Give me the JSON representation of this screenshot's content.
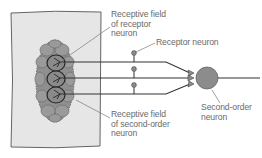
{
  "figure": {
    "labels": {
      "receptive_field_receptor": "Receptive field\nof receptor\nneuron",
      "receptor_neuron": "Receptor neuron",
      "receptive_field_second_order": "Receptive field\nof second-order\nneuron",
      "second_order_neuron": "Second-order\nneuron"
    },
    "colors": {
      "skin_fill": "#e6e6e6",
      "skin_border": "#555555",
      "field_fill": "#8f8f8f",
      "field_cell_stroke": "#6e6e6e",
      "receptor_field_stroke": "#262626",
      "axon": "#333333",
      "neuron_fill": "#8c8c8c",
      "label_text": "#6a6a6a",
      "leader_line": "#7a7a7a"
    },
    "receptor_count": 3
  }
}
